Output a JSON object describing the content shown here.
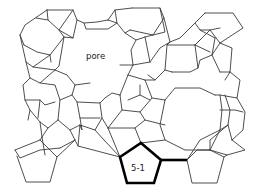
{
  "diagram": {
    "labels": {
      "pore": "pore",
      "ring": "5-1"
    },
    "colors": {
      "edge": "#3a3a3a",
      "highlight": "#000000",
      "background": "#ffffff"
    },
    "highlighted_unit": "5-1 pentagon"
  }
}
